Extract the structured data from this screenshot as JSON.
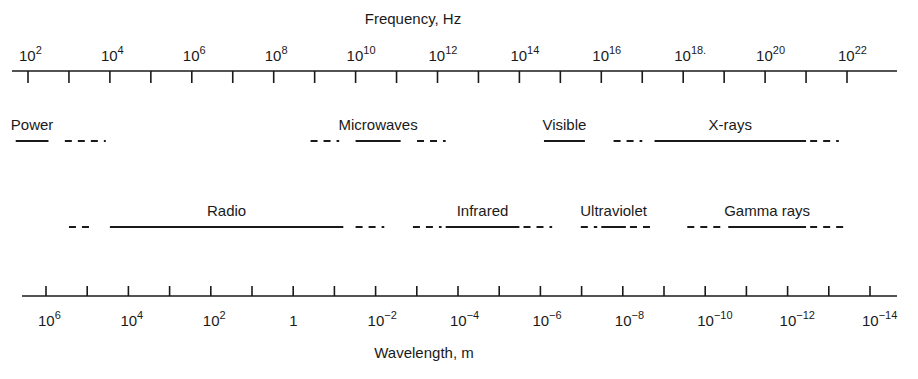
{
  "frequency_axis": {
    "title": "Frequency, Hz",
    "unit": "Hz",
    "labels": [
      {
        "base": "10",
        "exp": "2"
      },
      {
        "base": "10",
        "exp": "4"
      },
      {
        "base": "10",
        "exp": "6"
      },
      {
        "base": "10",
        "exp": "8"
      },
      {
        "base": "10",
        "exp": "10"
      },
      {
        "base": "10",
        "exp": "12"
      },
      {
        "base": "10",
        "exp": "14"
      },
      {
        "base": "10",
        "exp": "16"
      },
      {
        "base": "10",
        "exp": "18."
      },
      {
        "base": "10",
        "exp": "20"
      },
      {
        "base": "10",
        "exp": "22"
      }
    ],
    "log10_range": [
      2,
      22
    ],
    "tick_step_decades": 1
  },
  "wavelength_axis": {
    "title": "Wavelength, m",
    "unit": "m",
    "labels": [
      {
        "base": "10",
        "exp": "6"
      },
      {
        "base": "10",
        "exp": "4"
      },
      {
        "base": "10",
        "exp": "2"
      },
      {
        "base": "1",
        "exp": ""
      },
      {
        "base": "10",
        "exp": "-2"
      },
      {
        "base": "10",
        "exp": "-4"
      },
      {
        "base": "10",
        "exp": "-6"
      },
      {
        "base": "10",
        "exp": "-8"
      },
      {
        "base": "10",
        "exp": "-10"
      },
      {
        "base": "10",
        "exp": "-12"
      },
      {
        "base": "10",
        "exp": "-14"
      }
    ],
    "log10_range": [
      6,
      -14
    ],
    "tick_step_decades": 1
  },
  "bands": [
    {
      "name": "Power",
      "row": 1,
      "solid_log10_hz": [
        1.7,
        2.5
      ],
      "dashed_log10_hz": [
        [
          2.9,
          3.9
        ]
      ]
    },
    {
      "name": "Microwaves",
      "row": 1,
      "solid_log10_hz": [
        10.0,
        11.1
      ],
      "dashed_log10_hz": [
        [
          8.9,
          9.6
        ],
        [
          11.5,
          12.2
        ]
      ]
    },
    {
      "name": "Visible",
      "row": 1,
      "solid_log10_hz": [
        14.6,
        15.6
      ],
      "dashed_log10_hz": []
    },
    {
      "name": "X-rays",
      "row": 1,
      "solid_log10_hz": [
        17.3,
        21.0
      ],
      "dashed_log10_hz": [
        [
          16.3,
          17.0
        ],
        [
          21.1,
          21.8
        ]
      ]
    },
    {
      "name": "Radio",
      "row": 2,
      "solid_log10_hz": [
        4.0,
        9.7
      ],
      "dashed_log10_hz": [
        [
          3.0,
          3.6
        ],
        [
          10.0,
          10.7
        ]
      ]
    },
    {
      "name": "Infrared",
      "row": 2,
      "solid_log10_hz": [
        12.2,
        14.0
      ],
      "dashed_log10_hz": [
        [
          11.4,
          12.1
        ],
        [
          14.1,
          14.8
        ]
      ]
    },
    {
      "name": "Ultraviolet",
      "row": 2,
      "solid_log10_hz": [
        16.0,
        16.6
      ],
      "dashed_log10_hz": [
        [
          15.5,
          15.9
        ],
        [
          16.7,
          17.3
        ]
      ]
    },
    {
      "name": "Gamma rays",
      "row": 2,
      "solid_log10_hz": [
        19.1,
        21.0
      ],
      "dashed_log10_hz": [
        [
          18.1,
          19.0
        ],
        [
          21.1,
          22.0
        ]
      ]
    }
  ]
}
